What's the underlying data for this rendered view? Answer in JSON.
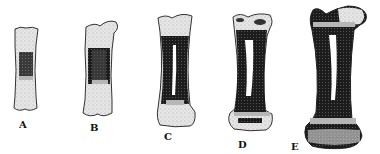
{
  "figure": {
    "stages": [
      {
        "label": "A",
        "name": "stage-a"
      },
      {
        "label": "B",
        "name": "stage-b"
      },
      {
        "label": "C",
        "name": "stage-c"
      },
      {
        "label": "D",
        "name": "stage-d"
      },
      {
        "label": "E",
        "name": "stage-e"
      }
    ],
    "colors": {
      "cartilage": "#e4e4e4",
      "bone": "#1a1a1a",
      "marrow": "#ffffff",
      "outline": "#222222"
    }
  }
}
